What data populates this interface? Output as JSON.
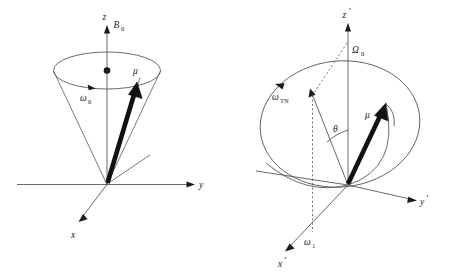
{
  "figure": {
    "background_color": "#ffffff",
    "line_color": "#58585a",
    "vector_color": "#111111",
    "panel_count": 2
  },
  "panel_left": {
    "name": "laboratory-frame-precession",
    "axes": [
      {
        "id": "z",
        "label": "z",
        "italic": true
      },
      {
        "id": "y",
        "label": "y",
        "italic": true
      },
      {
        "id": "x",
        "label": "x",
        "italic": true
      }
    ],
    "labels": {
      "field": "B",
      "field_sub": "0",
      "precession": "ω",
      "precession_sub": "0",
      "moment": "μ"
    },
    "elements": [
      "z-axis-arrow",
      "y-axis-arrow",
      "x-axis-arrow",
      "precession-cone",
      "precession-ellipse",
      "precession-direction-arrow",
      "magnetic-moment-vector",
      "cone-axis-dot",
      "tangent-line"
    ]
  },
  "panel_right": {
    "name": "rotating-frame-nutation",
    "axes": [
      {
        "id": "z-prime",
        "label": "z",
        "prime": "′",
        "italic": true
      },
      {
        "id": "y-prime",
        "label": "y",
        "prime": "′",
        "italic": true
      },
      {
        "id": "x-prime",
        "label": "x",
        "prime": "′",
        "italic": true
      }
    ],
    "labels": {
      "offset": "Ω",
      "offset_sub": "0",
      "nutation": "ω",
      "nutation_sub": "TN",
      "rf_field": "ω",
      "rf_field_sub": "1",
      "angle": "θ",
      "moment": "μ"
    },
    "elements": [
      "z-prime-axis-arrow",
      "y-prime-axis-arrow",
      "x-prime-axis-arrow",
      "nutation-circle",
      "nutation-direction-arrow",
      "effective-field-vector",
      "effective-field-dashed-projection",
      "theta-angle-arc",
      "magnetic-moment-vector",
      "moment-trajectory-arc",
      "horizon-line"
    ]
  }
}
